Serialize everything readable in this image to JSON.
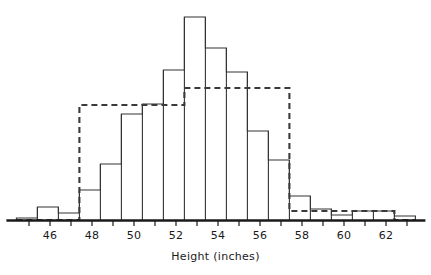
{
  "chart_data": {
    "type": "bar",
    "title": "",
    "subtitle": "",
    "xlabel": "Height (inches)",
    "ylabel": "",
    "grid": false,
    "legend": "none",
    "xlim": [
      44.4,
      63.4
    ],
    "ylim": [
      0,
      203
    ],
    "xticks": [
      46,
      48,
      50,
      52,
      54,
      56,
      58,
      60,
      62
    ],
    "xtick_labels": [
      "46",
      "48",
      "50",
      "52",
      "54",
      "56",
      "58",
      "60",
      "62"
    ],
    "minor_tick_interval": 1,
    "bin_width": 1,
    "bin_edges": [
      44.4,
      45.4,
      46.4,
      47.4,
      48.4,
      49.4,
      50.4,
      51.4,
      52.4,
      53.4,
      54.4,
      55.4,
      56.4,
      57.4,
      58.4,
      59.4,
      60.4,
      61.4,
      62.4,
      63.4
    ],
    "bin_centers": [
      44.9,
      45.9,
      46.9,
      47.9,
      48.9,
      49.9,
      50.9,
      51.9,
      52.9,
      53.9,
      54.9,
      55.9,
      56.9,
      57.9,
      58.9,
      59.9,
      60.9,
      61.9,
      62.9
    ],
    "values": [
      2,
      13,
      7,
      30,
      56,
      106,
      116,
      150,
      203,
      172,
      148,
      89,
      60,
      24,
      11,
      5,
      9,
      9,
      4
    ],
    "series": [
      {
        "name": "observed-histogram",
        "style": "solid-outline",
        "color": "#333333",
        "values": [
          2,
          13,
          7,
          30,
          56,
          106,
          116,
          150,
          203,
          172,
          148,
          89,
          60,
          24,
          11,
          5,
          9,
          9,
          4
        ]
      },
      {
        "name": "fitted-overlay",
        "style": "dashed-outline",
        "color": "#3a3a3a",
        "edges": [
          44.4,
          47.4,
          52.4,
          57.4,
          59.4,
          62.4,
          63.4
        ],
        "values": [
          0,
          115,
          132,
          9,
          9,
          0
        ]
      }
    ],
    "annotations": []
  },
  "axis": {
    "x_label": "Height (inches)"
  },
  "colors": {
    "axis": "#1a1a1a",
    "bar_outline": "#333333",
    "overlay_dashed": "#3a3a3a",
    "background": "#ffffff",
    "text": "#1a1a1a"
  }
}
